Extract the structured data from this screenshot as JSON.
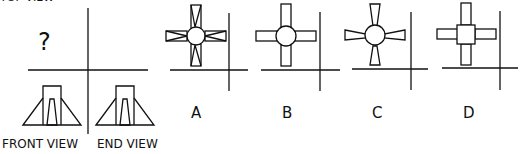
{
  "title_partial": "TOP VIEW",
  "question_mark": "?",
  "labels": {
    "front": "FRONT VIEW",
    "end": "END VIEW"
  },
  "options": [
    {
      "letter": "A",
      "description": "circle with four tapered (wedge-lined) rectangular arms"
    },
    {
      "letter": "B",
      "description": "circle with four plain rectangular arms"
    },
    {
      "letter": "C",
      "description": "circle with four flared trapezoidal arms"
    },
    {
      "letter": "D",
      "description": "square with four plain rectangular arms"
    }
  ],
  "colors": {
    "stroke": "#111111",
    "background": "#ffffff"
  }
}
